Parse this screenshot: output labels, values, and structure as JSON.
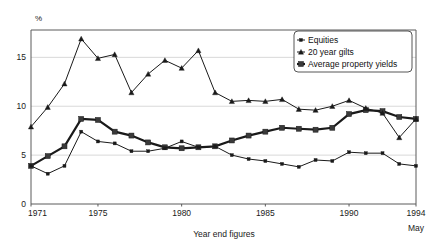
{
  "chart_data": {
    "type": "line",
    "title": "",
    "xlabel": "Year end figures",
    "ylabel": "%",
    "xlim": [
      1971,
      1994
    ],
    "ylim": [
      0,
      17.8
    ],
    "grid": true,
    "legend_position": "top-right",
    "x_tick_labels": [
      "1971",
      "1975",
      "1980",
      "1985",
      "1990",
      "1994"
    ],
    "x_tick_values": [
      1971,
      1975,
      1980,
      1985,
      1990,
      1994
    ],
    "x_last_tick_sublabel": "May",
    "y_tick_labels": [
      "0",
      "5",
      "10",
      "15"
    ],
    "y_tick_values": [
      0,
      5,
      10,
      15
    ],
    "x": [
      1971,
      1972,
      1973,
      1974,
      1975,
      1976,
      1977,
      1978,
      1979,
      1980,
      1981,
      1982,
      1983,
      1984,
      1985,
      1986,
      1987,
      1988,
      1989,
      1990,
      1991,
      1992,
      1993,
      1994
    ],
    "series": [
      {
        "name": "Equities",
        "marker": "small-square",
        "line_width": 1.0,
        "values": [
          3.9,
          3.1,
          3.9,
          7.4,
          6.4,
          6.2,
          5.4,
          5.4,
          5.7,
          6.4,
          5.8,
          5.9,
          5.0,
          4.6,
          4.4,
          4.1,
          3.8,
          4.5,
          4.4,
          5.3,
          5.2,
          5.2,
          4.1,
          3.9
        ]
      },
      {
        "name": "20 year gilts",
        "marker": "triangle",
        "line_width": 1.0,
        "values": [
          7.9,
          9.9,
          12.3,
          16.9,
          14.9,
          15.3,
          11.4,
          13.3,
          14.7,
          13.9,
          15.7,
          11.4,
          10.5,
          10.6,
          10.5,
          10.7,
          9.7,
          9.6,
          10.0,
          10.6,
          9.8,
          9.3,
          6.8,
          8.7
        ]
      },
      {
        "name": "Average property yields",
        "marker": "large-square",
        "line_width": 2.2,
        "values": [
          3.9,
          4.9,
          5.9,
          8.7,
          8.6,
          7.4,
          7.0,
          6.3,
          5.8,
          5.7,
          5.8,
          5.9,
          6.5,
          7.0,
          7.4,
          7.8,
          7.7,
          7.6,
          7.8,
          9.2,
          9.6,
          9.5,
          8.9,
          8.7
        ]
      }
    ]
  },
  "legend": {
    "entries": [
      {
        "label": "Equities"
      },
      {
        "label": "20 year gilts"
      },
      {
        "label": "Average property yields"
      }
    ]
  }
}
